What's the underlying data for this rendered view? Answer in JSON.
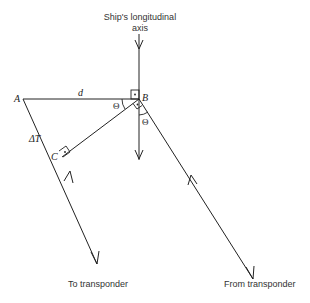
{
  "diagram": {
    "axis_label_line1": "Ship's longitudinal",
    "axis_label_line2": "axis",
    "points": {
      "A": "A",
      "B": "B",
      "C": "C"
    },
    "segment_d": "d",
    "segment_dT": "ΔT",
    "angle_1": "Θ",
    "angle_2": "Θ",
    "bottom_left_label": "To transponder",
    "bottom_right_label": "From transponder",
    "colors": {
      "line": "#222222",
      "background": "#ffffff"
    }
  }
}
